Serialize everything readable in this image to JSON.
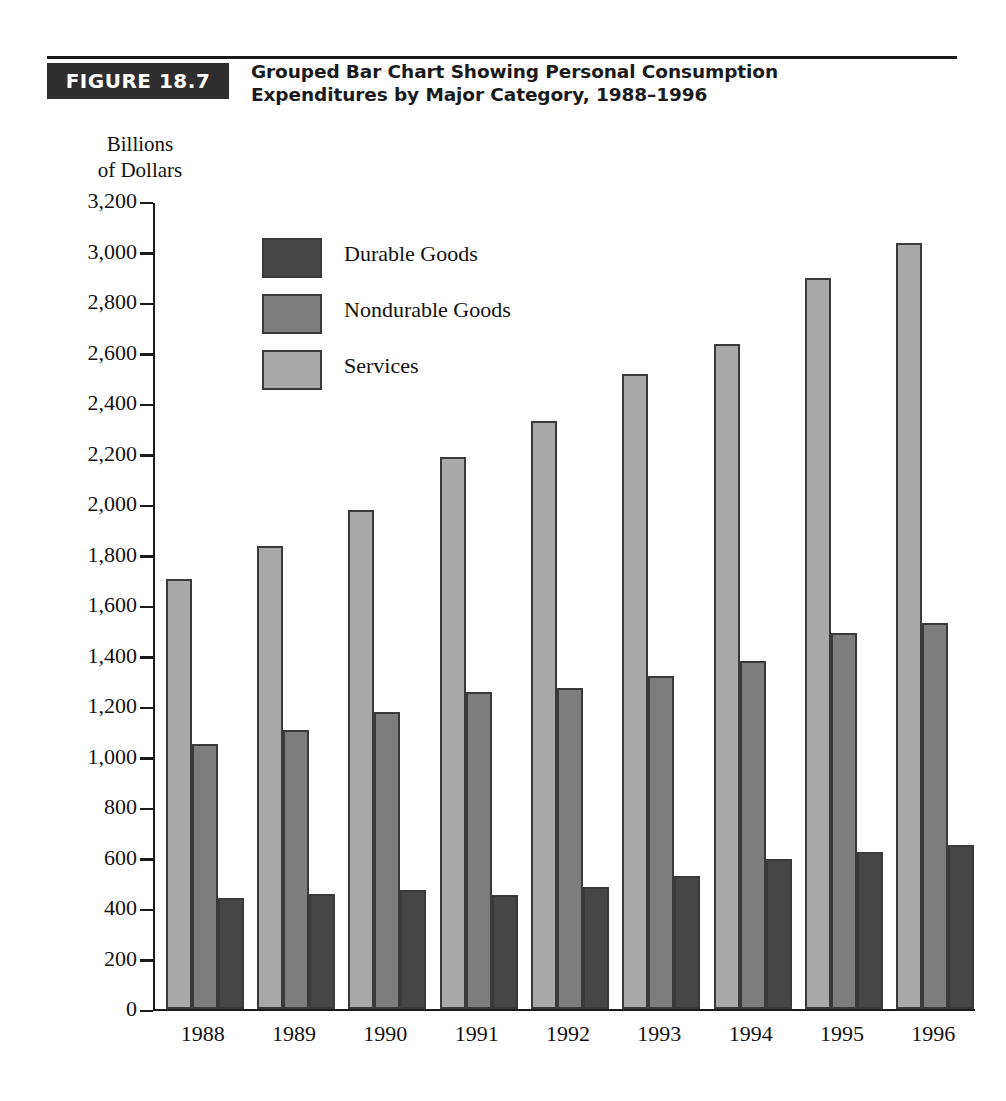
{
  "figure": {
    "tag": "FIGURE 18.7",
    "title_line1": "Grouped Bar Chart Showing Personal Consumption",
    "title_line2": "Expenditures by Major Category, 1988–1996"
  },
  "axis_caption": {
    "line1": "Billions",
    "line2": "of Dollars"
  },
  "legend": {
    "items": [
      {
        "label": "Durable Goods",
        "series": "durable",
        "color": "#464646"
      },
      {
        "label": "Nondurable Goods",
        "series": "nondurable",
        "color": "#7d7d7d"
      },
      {
        "label": "Services",
        "series": "services",
        "color": "#a9a9a9"
      }
    ]
  },
  "chart_data": {
    "type": "bar",
    "title": "Grouped Bar Chart Showing Personal Consumption Expenditures by Major Category, 1988–1996",
    "xlabel": "",
    "ylabel": "Billions of Dollars",
    "ylim": [
      0,
      3200
    ],
    "ytick_step": 200,
    "yticks": [
      0,
      200,
      400,
      600,
      800,
      1000,
      1200,
      1400,
      1600,
      1800,
      2000,
      2200,
      2400,
      2600,
      2800,
      3000,
      3200
    ],
    "ytick_labels": [
      "0",
      "200",
      "400",
      "600",
      "800",
      "1,000",
      "1,200",
      "1,400",
      "1,600",
      "1,800",
      "2,000",
      "2,200",
      "2,400",
      "2,600",
      "2,800",
      "3,000",
      "3,200"
    ],
    "categories": [
      "1988",
      "1989",
      "1990",
      "1991",
      "1992",
      "1993",
      "1994",
      "1995",
      "1996"
    ],
    "grid": false,
    "legend_position": "inside-upper-left",
    "bar_order_in_group": [
      "Services",
      "Nondurable Goods",
      "Durable Goods"
    ],
    "series": [
      {
        "name": "Services",
        "color": "#a9a9a9",
        "values": [
          1705,
          1835,
          1975,
          2185,
          2330,
          2515,
          2635,
          2895,
          3035
        ]
      },
      {
        "name": "Nondurable Goods",
        "color": "#7d7d7d",
        "values": [
          1050,
          1105,
          1175,
          1255,
          1270,
          1320,
          1380,
          1490,
          1530
        ]
      },
      {
        "name": "Durable Goods",
        "color": "#464646",
        "values": [
          440,
          455,
          470,
          450,
          485,
          525,
          595,
          620,
          650
        ]
      }
    ]
  }
}
